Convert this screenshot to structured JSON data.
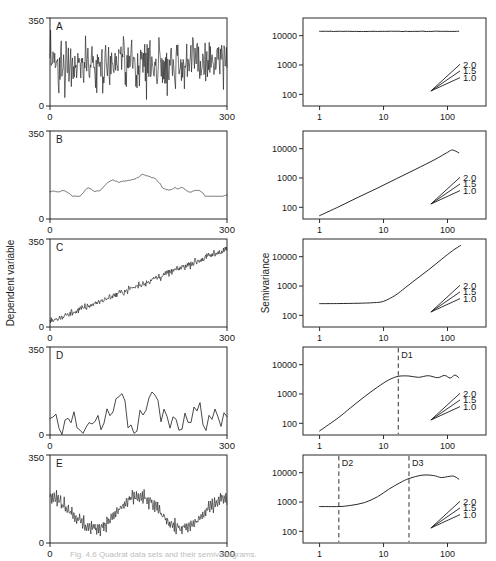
{
  "figure": {
    "caption": "Fig. 4.6 Quadrat data sets and their semivariograms.",
    "left_axis_title": "Dependent variable",
    "left_x_title": "Quadrat sequence",
    "right_axis_title": "Semivariance",
    "right_x_title": "Distance"
  },
  "left_axis": {
    "y_ticks": [
      "0",
      "350"
    ],
    "x_ticks": [
      "0",
      "300"
    ],
    "ymin": 0,
    "ymax": 350,
    "xmin": 0,
    "xmax": 300
  },
  "right_axis": {
    "y_ticks": [
      "100",
      "1000",
      "10000"
    ],
    "x_ticks": [
      "1",
      "10",
      "100"
    ],
    "ymin": 40,
    "ymax": 40000,
    "xmin": 0.55,
    "xmax": 400,
    "scale": "log-log"
  },
  "slope_fan": {
    "labels": [
      "1.0",
      "1.5",
      "2.0"
    ],
    "origin_distance": 55,
    "origin_semivariance": 130
  },
  "panels": [
    {
      "id": "A",
      "label": "A",
      "series_description": "white noise, dense high-frequency variation spanning full 0-350 range",
      "semivariogram_description": "pure nugget, flat sill",
      "markers": []
    },
    {
      "id": "B",
      "label": "B",
      "series_description": "random walk, slow wandering trend around mid range",
      "semivariogram_description": "unbounded linear rise on log-log, slope near 1.0",
      "markers": []
    },
    {
      "id": "C",
      "label": "C",
      "series_description": "linear increasing trend with small-scale noise",
      "semivariogram_description": "flat nugget then steep quadratic rise, slope near 2.0",
      "markers": []
    },
    {
      "id": "D",
      "label": "D",
      "series_description": "patchy, coarse oscillation between near 0 and mid values",
      "semivariogram_description": "rises to a sill then fluctuates",
      "markers": [
        "D1"
      ]
    },
    {
      "id": "E",
      "label": "E",
      "series_description": "broad wave with superimposed fine noise",
      "semivariogram_description": "nugget plateau, rise to sill, then hole effect",
      "markers": [
        "D2",
        "D3"
      ]
    }
  ],
  "chart_data": {
    "type": "line",
    "title": "Quadrat data sets and their semivariograms",
    "panel_count": 10,
    "left_column": {
      "xlabel": "Quadrat sequence",
      "ylabel": "Dependent variable",
      "xlim": [
        0,
        300
      ],
      "ylim": [
        0,
        350
      ],
      "grid": false,
      "series": [
        {
          "name": "A",
          "type": "white-noise",
          "mean": 170,
          "sd": 85,
          "range": [
            5,
            345
          ],
          "n_points": 300
        },
        {
          "name": "B",
          "type": "random-walk",
          "mean": 150,
          "range": [
            90,
            215
          ],
          "n_points": 300
        },
        {
          "name": "C",
          "type": "linear-trend-plus-noise",
          "intercept": 20,
          "slope_per_quadrat": 0.97,
          "noise_sd": 12,
          "range": [
            10,
            310
          ],
          "n_points": 300
        },
        {
          "name": "D",
          "type": "patchy-coarse",
          "range": [
            2,
            175
          ],
          "n_points": 60
        },
        {
          "name": "E",
          "type": "wave-plus-noise",
          "wave_period_quadrats": 150,
          "range": [
            25,
            215
          ],
          "n_points": 300
        }
      ]
    },
    "right_column": {
      "xlabel": "Distance",
      "ylabel": "Semivariance",
      "xscale": "log",
      "yscale": "log",
      "xlim": [
        0.55,
        400
      ],
      "ylim": [
        40,
        40000
      ],
      "xticks": [
        1,
        10,
        100
      ],
      "yticks": [
        100,
        1000,
        10000
      ],
      "grid": false,
      "reference_slopes": [
        1.0,
        1.5,
        2.0
      ],
      "series": [
        {
          "name": "A",
          "model": "pure nugget",
          "points": [
            {
              "d": 1,
              "g": 14000
            },
            {
              "d": 2,
              "g": 13900
            },
            {
              "d": 4,
              "g": 14100
            },
            {
              "d": 8,
              "g": 14000
            },
            {
              "d": 16,
              "g": 14200
            },
            {
              "d": 32,
              "g": 14000
            },
            {
              "d": 64,
              "g": 14300
            },
            {
              "d": 120,
              "g": 14200
            },
            {
              "d": 150,
              "g": 14100
            }
          ],
          "sill": 14000,
          "range_distance": null
        },
        {
          "name": "B",
          "model": "unbounded power, slope ~1",
          "points": [
            {
              "d": 1,
              "g": 52
            },
            {
              "d": 2,
              "g": 105
            },
            {
              "d": 4,
              "g": 220
            },
            {
              "d": 8,
              "g": 450
            },
            {
              "d": 16,
              "g": 950
            },
            {
              "d": 32,
              "g": 2000
            },
            {
              "d": 64,
              "g": 4300
            },
            {
              "d": 100,
              "g": 7500
            },
            {
              "d": 120,
              "g": 9000
            },
            {
              "d": 150,
              "g": 7200
            }
          ],
          "sill": null,
          "range_distance": null
        },
        {
          "name": "C",
          "model": "nugget plus strong trend, slope ~2",
          "points": [
            {
              "d": 1,
              "g": 250
            },
            {
              "d": 2,
              "g": 252
            },
            {
              "d": 4,
              "g": 258
            },
            {
              "d": 7,
              "g": 270
            },
            {
              "d": 10,
              "g": 300
            },
            {
              "d": 15,
              "g": 470
            },
            {
              "d": 20,
              "g": 750
            },
            {
              "d": 30,
              "g": 1500
            },
            {
              "d": 50,
              "g": 3500
            },
            {
              "d": 80,
              "g": 8000
            },
            {
              "d": 120,
              "g": 16000
            },
            {
              "d": 160,
              "g": 24000
            }
          ],
          "sill": null,
          "range_distance": null
        },
        {
          "name": "D",
          "model": "spherical with sill and fluctuation",
          "points": [
            {
              "d": 1,
              "g": 55
            },
            {
              "d": 2,
              "g": 160
            },
            {
              "d": 3,
              "g": 330
            },
            {
              "d": 5,
              "g": 800
            },
            {
              "d": 8,
              "g": 1700
            },
            {
              "d": 12,
              "g": 3000
            },
            {
              "d": 17,
              "g": 4000
            },
            {
              "d": 25,
              "g": 4100
            },
            {
              "d": 35,
              "g": 3700
            },
            {
              "d": 50,
              "g": 4200
            },
            {
              "d": 70,
              "g": 3600
            },
            {
              "d": 90,
              "g": 4300
            },
            {
              "d": 110,
              "g": 3500
            },
            {
              "d": 130,
              "g": 4400
            },
            {
              "d": 150,
              "g": 3600
            }
          ],
          "sill": 4000,
          "range_distance": 17,
          "marker_labels": [
            "D1"
          ],
          "marker_distances": [
            17
          ]
        },
        {
          "name": "E",
          "model": "nugget, rise to sill, hole effect",
          "points": [
            {
              "d": 1,
              "g": 700
            },
            {
              "d": 2,
              "g": 700
            },
            {
              "d": 3,
              "g": 760
            },
            {
              "d": 5,
              "g": 950
            },
            {
              "d": 8,
              "g": 1500
            },
            {
              "d": 12,
              "g": 2700
            },
            {
              "d": 18,
              "g": 4500
            },
            {
              "d": 25,
              "g": 6300
            },
            {
              "d": 40,
              "g": 8200
            },
            {
              "d": 60,
              "g": 8000
            },
            {
              "d": 80,
              "g": 6800
            },
            {
              "d": 100,
              "g": 7300
            },
            {
              "d": 125,
              "g": 7600
            },
            {
              "d": 150,
              "g": 6000
            }
          ],
          "sill": 8000,
          "range_distance": 25,
          "marker_labels": [
            "D2",
            "D3"
          ],
          "marker_distances": [
            2,
            25
          ]
        }
      ]
    }
  }
}
